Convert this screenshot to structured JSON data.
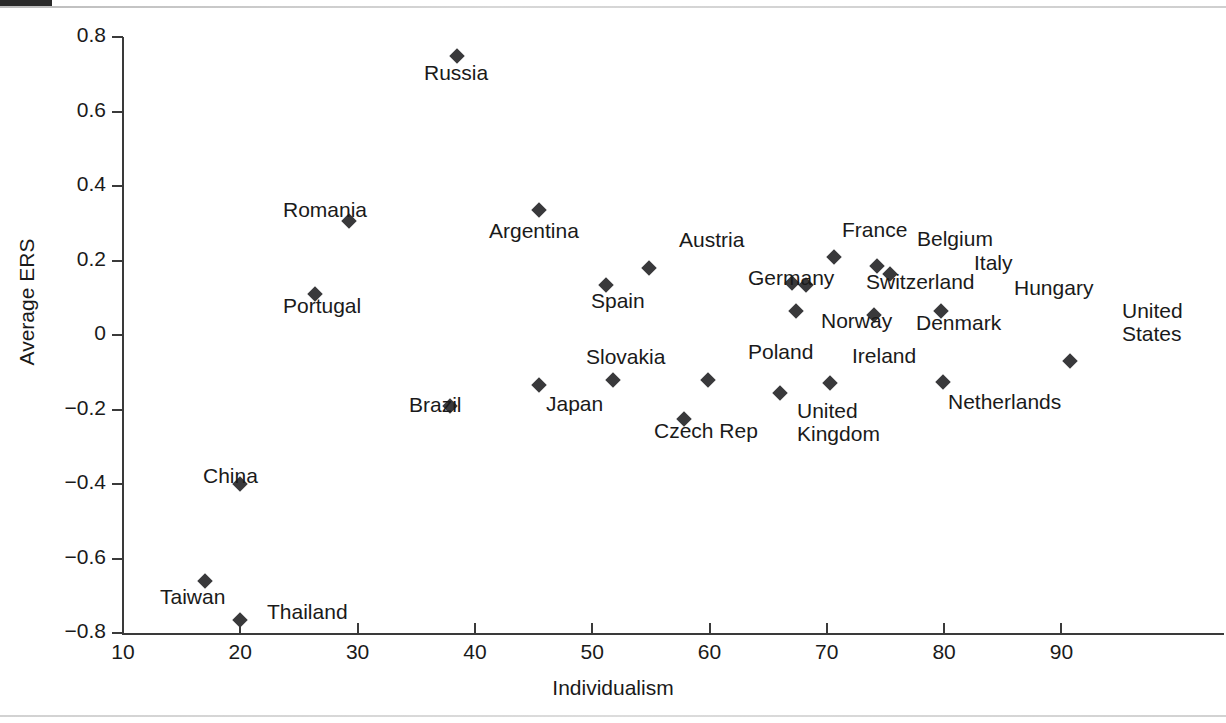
{
  "chart_data": {
    "type": "scatter",
    "title": "",
    "xlabel": "Individualism",
    "ylabel": "Average ERS",
    "xlim": [
      10,
      94
    ],
    "ylim": [
      -0.8,
      0.8
    ],
    "xticks": [
      "10",
      "20",
      "30",
      "40",
      "50",
      "60",
      "70",
      "80",
      "90"
    ],
    "xtick_values": [
      10,
      20,
      30,
      40,
      50,
      60,
      70,
      80,
      90
    ],
    "yticks": [
      "0.8",
      "0.6",
      "0.4",
      "0.2",
      "0",
      "−0.2",
      "−0.4",
      "−0.6",
      "−0.8"
    ],
    "ytick_values": [
      0.8,
      0.6,
      0.4,
      0.2,
      0,
      -0.2,
      -0.4,
      -0.6,
      -0.8
    ],
    "grid": false,
    "legend": "none",
    "marker": "diamond",
    "marker_color": "#39393b",
    "points": [
      {
        "label": "Russia",
        "x": 38.5,
        "y": 0.75,
        "lx": 424,
        "ly": 62
      },
      {
        "label": "Romania",
        "x": 29.3,
        "y": 0.305,
        "lx": 283,
        "ly": 199
      },
      {
        "label": "Portugal",
        "x": 26.4,
        "y": 0.11,
        "lx": 283,
        "ly": 295
      },
      {
        "label": "Argentina",
        "x": 45.5,
        "y": 0.335,
        "lx": 489,
        "ly": 220
      },
      {
        "label": "Austria",
        "x": 54.8,
        "y": 0.18,
        "lx": 679,
        "ly": 229
      },
      {
        "label": "Spain",
        "x": 51.2,
        "y": 0.135,
        "lx": 591,
        "ly": 290
      },
      {
        "label": "France",
        "x": 70.6,
        "y": 0.21,
        "lx": 842,
        "ly": 219
      },
      {
        "label": "Belgium",
        "x": 74.3,
        "y": 0.185,
        "lx": 917,
        "ly": 228
      },
      {
        "label": "Italy",
        "x": 75.4,
        "y": 0.165,
        "lx": 974,
        "ly": 252
      },
      {
        "label": "Germany",
        "x": 67.0,
        "y": 0.14,
        "lx": 748,
        "ly": 267
      },
      {
        "label": "Switzerland",
        "x": 68.2,
        "y": 0.135,
        "lx": 866,
        "ly": 271
      },
      {
        "label": "Hungary",
        "x": 79.7,
        "y": 0.065,
        "lx": 1014,
        "ly": 277
      },
      {
        "label": "Norway",
        "x": 67.4,
        "y": 0.065,
        "lx": 821,
        "ly": 310
      },
      {
        "label": "Denmark",
        "x": 74.0,
        "y": 0.055,
        "lx": 916,
        "ly": 312
      },
      {
        "label": "United\nStates",
        "x": 90.7,
        "y": -0.07,
        "lx": 1122,
        "ly": 300
      },
      {
        "label": "Poland",
        "x": 59.9,
        "y": -0.12,
        "lx": 748,
        "ly": 341
      },
      {
        "label": "Slovakia",
        "x": 51.8,
        "y": -0.12,
        "lx": 586,
        "ly": 346
      },
      {
        "label": "Japan",
        "x": 45.5,
        "y": -0.135,
        "lx": 546,
        "ly": 393
      },
      {
        "label": "Ireland",
        "x": 70.3,
        "y": -0.13,
        "lx": 852,
        "ly": 345
      },
      {
        "label": "Netherlands",
        "x": 79.9,
        "y": -0.125,
        "lx": 948,
        "ly": 391
      },
      {
        "label": "United\nKingdom",
        "x": 66.0,
        "y": -0.155,
        "lx": 797,
        "ly": 400
      },
      {
        "label": "Brazil",
        "x": 37.9,
        "y": -0.19,
        "lx": 409,
        "ly": 394
      },
      {
        "label": "Czech Rep",
        "x": 57.8,
        "y": -0.225,
        "lx": 654,
        "ly": 420
      },
      {
        "label": "China",
        "x": 20.0,
        "y": -0.4,
        "lx": 203,
        "ly": 465
      },
      {
        "label": "Taiwan",
        "x": 17.0,
        "y": -0.66,
        "lx": 160,
        "ly": 586
      },
      {
        "label": "Thailand",
        "x": 20.0,
        "y": -0.765,
        "lx": 267,
        "ly": 601
      }
    ]
  }
}
